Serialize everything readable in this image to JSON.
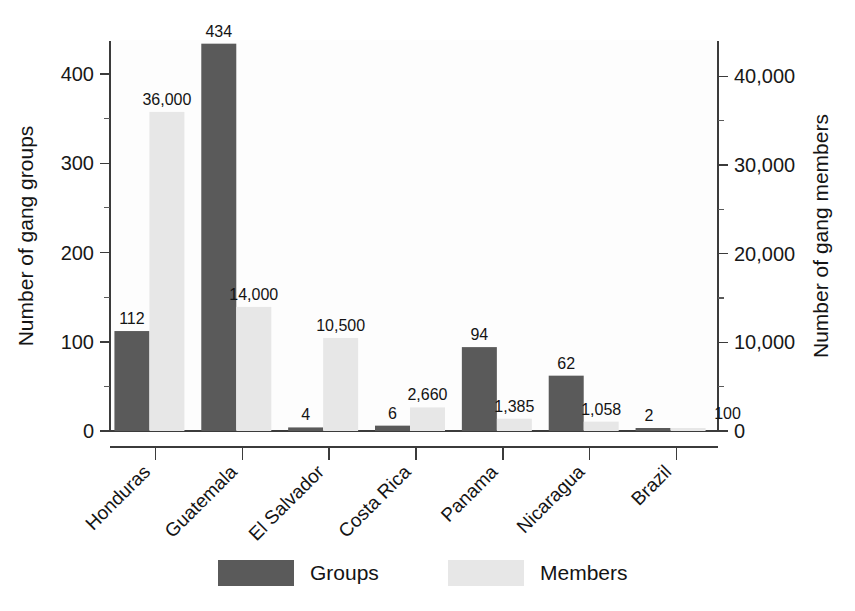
{
  "chart_data": {
    "type": "bar",
    "title": "",
    "subtitle": "",
    "xlabel": "",
    "ylabel": "Number of gang groups",
    "y2label": "Number of gang members",
    "categories": [
      "Honduras",
      "Guatemala",
      "El Salvador",
      "Costa Rica",
      "Panama",
      "Nicaragua",
      "Brazil"
    ],
    "series": [
      {
        "name": "Groups",
        "axis": "left",
        "color": "#5a5a5a",
        "values": [
          112,
          434,
          4,
          6,
          94,
          62,
          2
        ],
        "labels": [
          "112",
          "434",
          "4",
          "6",
          "94",
          "62",
          "2"
        ]
      },
      {
        "name": "Members",
        "axis": "right",
        "color": "#e7e7e7",
        "values": [
          36000,
          14000,
          10500,
          2660,
          1385,
          1058,
          100
        ],
        "labels": [
          "36,000",
          "14,000",
          "10,500",
          "2,660",
          "1,385",
          "1,058",
          "100"
        ]
      }
    ],
    "left_axis": {
      "ticks": [
        0,
        100,
        200,
        300,
        400
      ],
      "tick_labels": [
        "0",
        "100",
        "200",
        "300",
        "400"
      ],
      "ylim": [
        0,
        437
      ]
    },
    "right_axis": {
      "ticks": [
        0,
        10000,
        20000,
        30000,
        40000
      ],
      "tick_labels": [
        "0",
        "10,000",
        "20,000",
        "30,000",
        "40,000"
      ],
      "ylim": [
        0,
        44000
      ]
    },
    "legend": {
      "position": "bottom",
      "entries": [
        {
          "label": "Groups",
          "color": "#5a5a5a"
        },
        {
          "label": "Members",
          "color": "#e7e7e7"
        }
      ]
    },
    "grid": false
  }
}
